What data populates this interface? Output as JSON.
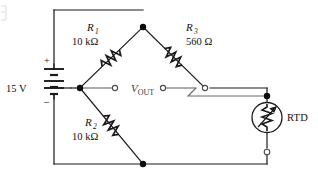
{
  "figure": {
    "type": "circuit-schematic",
    "width": 318,
    "height": 179,
    "background": "#ffffff",
    "line_color": "#1a1a1a"
  },
  "source": {
    "name": "dc-voltage-source",
    "label": "15 V",
    "voltage": "15",
    "unit": "V",
    "plus_sign": "+",
    "minus_sign": "–",
    "symbol": "multi-cell-battery"
  },
  "components": [
    {
      "id": "R1",
      "ref": "R",
      "subscript": "1",
      "value": "10 kΩ",
      "symbol": "resistor-zigzag",
      "branch": "top-left"
    },
    {
      "id": "R3",
      "ref": "R",
      "subscript": "3",
      "value": "560 Ω",
      "symbol": "resistor-zigzag",
      "branch": "top-right"
    },
    {
      "id": "R2",
      "ref": "R",
      "subscript": "2",
      "value": "10 kΩ",
      "symbol": "resistor-zigzag",
      "branch": "bottom-left"
    },
    {
      "id": "RTD",
      "ref": "RTD",
      "subscript": "",
      "value": "",
      "symbol": "rtd-sensor-circle-resistor",
      "branch": "bottom-right"
    }
  ],
  "output": {
    "name": "bridge-output",
    "label": "V",
    "subscript": "OUT",
    "full_label": "V_OUT",
    "terminals": 2,
    "terminal_style": "open-circle"
  },
  "nodes": [
    {
      "name": "top-node",
      "style": "filled-dot"
    },
    {
      "name": "left-node",
      "style": "filled-dot"
    },
    {
      "name": "bottom-node",
      "style": "filled-dot"
    },
    {
      "name": "rtd-top-node",
      "style": "filled-dot"
    },
    {
      "name": "vout-left-terminal",
      "style": "open-circle"
    },
    {
      "name": "vout-right-terminal",
      "style": "open-circle"
    },
    {
      "name": "r3-bottom-terminal",
      "style": "open-circle"
    },
    {
      "name": "rtd-bottom-terminal",
      "style": "open-circle"
    }
  ]
}
